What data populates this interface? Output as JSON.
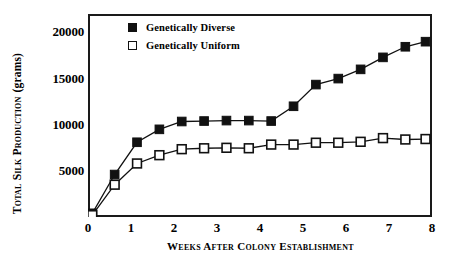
{
  "chart_data": {
    "type": "line",
    "title": "",
    "xlabel": "Weeks After Colony Establishment",
    "ylabel": "Total Silk Production (grams)",
    "ylabel_main": "Total Silk Production",
    "ylabel_unit": "(grams)",
    "xlim": [
      0,
      8
    ],
    "ylim": [
      0,
      22000
    ],
    "xticks": [
      0,
      1,
      2,
      3,
      4,
      5,
      6,
      7,
      8
    ],
    "xtick_labels": [
      "0",
      "1",
      "2",
      "3",
      "4",
      "5",
      "6",
      "7",
      "8"
    ],
    "yticks": [
      5000,
      10000,
      15000,
      20000
    ],
    "ytick_labels": [
      "5000",
      "10000",
      "15000",
      "20000"
    ],
    "grid": false,
    "legend_position": "top-left-inside",
    "x": [
      0.1,
      0.62,
      1.14,
      1.66,
      2.18,
      2.7,
      3.22,
      3.74,
      4.26,
      4.78,
      5.3,
      5.82,
      6.34,
      6.86,
      7.38,
      7.85
    ],
    "series": [
      {
        "name": "Genetically Diverse",
        "marker": "filled-square",
        "color": "#111111",
        "values": [
          400,
          4600,
          8100,
          9500,
          10350,
          10400,
          10450,
          10450,
          10400,
          12000,
          14350,
          15000,
          16000,
          17300,
          18450,
          19000
        ]
      },
      {
        "name": "Genetically Uniform",
        "marker": "open-square",
        "color": "#111111",
        "values": [
          200,
          3500,
          5800,
          6700,
          7350,
          7450,
          7500,
          7450,
          7850,
          7850,
          8050,
          8050,
          8150,
          8550,
          8400,
          8450
        ]
      }
    ]
  },
  "legend": {
    "items": [
      {
        "label": "Genetically Diverse",
        "marker": "filled"
      },
      {
        "label": "Genetically Uniform",
        "marker": "open"
      }
    ]
  },
  "colors": {
    "axis": "#1a1a1a",
    "line": "#111111",
    "background": "#ffffff"
  }
}
